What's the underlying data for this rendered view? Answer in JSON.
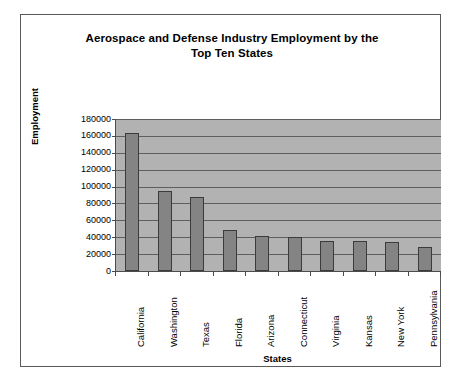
{
  "chart_data": {
    "type": "bar",
    "title": "Aerospace and Defense Industry Employment by the Top Ten States",
    "title_line1": "Aerospace and Defense Industry Employment by the",
    "title_line2": "Top Ten States",
    "xlabel": "States",
    "ylabel": "Employment",
    "categories": [
      "California",
      "Washington",
      "Texas",
      "Florida",
      "Arizona",
      "Connecticut",
      "Virginia",
      "Kansas",
      "New York",
      "Pennsylvania"
    ],
    "values": [
      163000,
      95000,
      88000,
      48000,
      42000,
      40000,
      36000,
      36000,
      34000,
      28000
    ],
    "ylim": [
      0,
      180000
    ],
    "ytick_values": [
      0,
      20000,
      40000,
      60000,
      80000,
      100000,
      120000,
      140000,
      160000,
      180000
    ],
    "ytick_labels": [
      "0",
      "20000",
      "40000",
      "60000",
      "80000",
      "100000",
      "120000",
      "140000",
      "160000",
      "180000"
    ],
    "grid": true,
    "legend": "none",
    "series": [
      {
        "name": "Employment",
        "values": [
          163000,
          95000,
          88000,
          48000,
          42000,
          40000,
          36000,
          36000,
          34000,
          28000
        ]
      }
    ],
    "colors": {
      "bar_fill": "#848484",
      "bar_border": "#3b3b3b",
      "plot_background": "#b2b2b2",
      "gridline": "#5e5e5e",
      "axis": "#4c4c4c",
      "frame": "#5a5a5a",
      "page_background": "#ffffff",
      "text": "#000000"
    }
  }
}
